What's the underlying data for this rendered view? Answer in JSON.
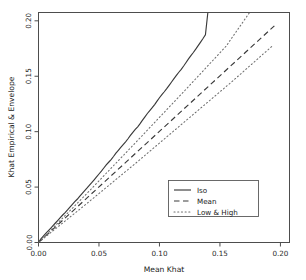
{
  "chart_data": {
    "type": "line",
    "title": "",
    "xlabel": "Mean Khat",
    "ylabel": "Khat Empirical & Envelope",
    "xlim": [
      0.0,
      0.2075
    ],
    "ylim": [
      0.0,
      0.2075
    ],
    "xticks": [
      0.0,
      0.05,
      0.1,
      0.15,
      0.2
    ],
    "xticklabels": [
      "0.00",
      "0.05",
      "0.10",
      "0.15",
      "0.20"
    ],
    "yticks": [
      0.0,
      0.05,
      0.1,
      0.15,
      0.2
    ],
    "yticklabels": [
      "0.00",
      "0.05",
      "0.10",
      "0.15",
      "0.20"
    ],
    "grid": false,
    "legend_position": "center-right",
    "series": [
      {
        "name": "Iso",
        "style": "solid",
        "color": "#3a3a3a",
        "x": [
          0.0,
          0.002,
          0.004,
          0.006,
          0.008,
          0.01,
          0.012,
          0.014,
          0.016,
          0.018,
          0.02,
          0.022,
          0.024,
          0.026,
          0.028,
          0.03,
          0.032,
          0.034,
          0.036,
          0.038,
          0.04,
          0.042,
          0.044,
          0.046,
          0.048,
          0.05,
          0.052,
          0.054,
          0.056,
          0.058,
          0.06,
          0.062,
          0.064,
          0.066,
          0.068,
          0.07,
          0.072,
          0.074,
          0.076,
          0.078,
          0.08,
          0.082,
          0.084,
          0.086,
          0.088,
          0.09,
          0.092,
          0.094,
          0.096,
          0.098,
          0.1,
          0.102,
          0.104,
          0.106,
          0.108,
          0.11,
          0.112,
          0.114,
          0.116,
          0.118,
          0.12,
          0.122,
          0.124,
          0.126,
          0.128,
          0.13,
          0.132,
          0.134,
          0.136,
          0.138,
          0.14
        ],
        "y": [
          0.0,
          0.0032,
          0.0058,
          0.0082,
          0.0105,
          0.0128,
          0.0152,
          0.0176,
          0.02,
          0.0224,
          0.0248,
          0.027,
          0.0294,
          0.032,
          0.0344,
          0.0368,
          0.039,
          0.0416,
          0.0442,
          0.0466,
          0.049,
          0.0516,
          0.054,
          0.0566,
          0.0592,
          0.0618,
          0.0644,
          0.0672,
          0.07,
          0.0724,
          0.0748,
          0.0776,
          0.0806,
          0.0832,
          0.0858,
          0.0884,
          0.0908,
          0.0936,
          0.0966,
          0.0994,
          0.102,
          0.1044,
          0.1072,
          0.1104,
          0.1134,
          0.1164,
          0.119,
          0.1216,
          0.1244,
          0.1276,
          0.1306,
          0.1334,
          0.136,
          0.1388,
          0.1418,
          0.1448,
          0.1478,
          0.1508,
          0.1536,
          0.1562,
          0.1592,
          0.1624,
          0.1656,
          0.1686,
          0.1714,
          0.1744,
          0.1776,
          0.1808,
          0.184,
          0.1874,
          0.2075
        ]
      },
      {
        "name": "Mean",
        "style": "dashed",
        "color": "#3a3a3a",
        "x": [
          0.0,
          0.195
        ],
        "y": [
          0.0,
          0.1955
        ]
      },
      {
        "name": "Low",
        "style": "dotted",
        "color": "#6e6e6e",
        "x": [
          0.0,
          0.04,
          0.08,
          0.12,
          0.16,
          0.193
        ],
        "y": [
          0.0,
          0.0352,
          0.0712,
          0.1082,
          0.1452,
          0.177
        ]
      },
      {
        "name": "High",
        "style": "dotted",
        "color": "#6e6e6e",
        "x": [
          0.0,
          0.04,
          0.08,
          0.12,
          0.155,
          0.1745
        ],
        "y": [
          0.0,
          0.0442,
          0.0898,
          0.136,
          0.177,
          0.2075
        ]
      }
    ],
    "legend": [
      {
        "label": "Iso",
        "style": "solid"
      },
      {
        "label": "Mean",
        "style": "dashed"
      },
      {
        "label": "Low & High",
        "style": "dotted"
      }
    ]
  }
}
